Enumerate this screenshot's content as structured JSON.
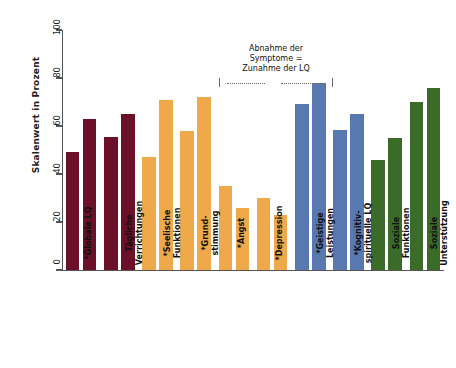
{
  "chart_data": {
    "type": "bar",
    "title": "",
    "xlabel": "",
    "ylabel": "Skalenwert in Prozent",
    "ylim": [
      0,
      100
    ],
    "yticks": [
      0,
      20,
      40,
      60,
      80,
      100
    ],
    "ytick_labels": [
      "0",
      "20",
      "40",
      "60",
      "80",
      "100"
    ],
    "grid": false,
    "legend": "none",
    "annotation": "Abnahme der\nSymptome =\nZunahme der LQ",
    "annotation_lines": [
      "Abnahme der",
      "Symptome =",
      "Zunahme der LQ"
    ],
    "categories": [
      "*Globale LQ",
      "Tägliche\nVerrichtungen",
      "*Seelische\nFunktionen",
      "*Grund-\nstimmung",
      "*Angst",
      "*Depression",
      "*Geistige\nLeistungen",
      "*Kognitiv-\nspirituelle LQ",
      "Soziale\nFunktionen",
      "Soziale\nUnterstützung"
    ],
    "group_colors": [
      "#6B1028",
      "#6B1028",
      "#EFA94A",
      "#EFA94A",
      "#EFA94A",
      "#EFA94A",
      "#5878B0",
      "#5878B0",
      "#3A6B28",
      "#3A6B28"
    ],
    "series": [
      {
        "name": "Messzeitpunkt 1",
        "values": [
          49,
          55.5,
          47,
          58,
          35,
          30,
          69,
          58.5,
          46,
          70
        ]
      },
      {
        "name": "Messzeitpunkt 2",
        "values": [
          63,
          65,
          71,
          72,
          26,
          23,
          78,
          65,
          55,
          76
        ]
      }
    ]
  },
  "colors": {
    "dark_red": "#6B1028",
    "orange": "#EFA94A",
    "blue": "#5878B0",
    "green": "#3A6B28",
    "axis": "#555555",
    "text": "#111111"
  }
}
